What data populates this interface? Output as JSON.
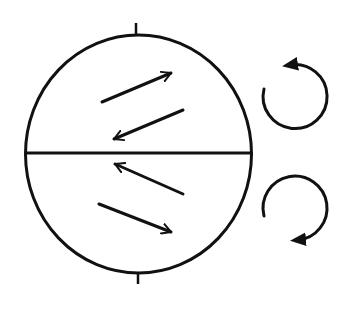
{
  "diagram": {
    "type": "globe-deflection",
    "colors": {
      "background": "#ffffff",
      "ink": "#111111"
    },
    "globe": {
      "cx": 138.5,
      "cy": 154,
      "rx": 113,
      "ry": 119,
      "stroke_width": 3
    },
    "equator": {
      "x1": 26,
      "y1": 153,
      "x2": 251,
      "y2": 153,
      "stroke_width": 3
    },
    "pole_ticks": [
      {
        "name": "north-pole-tick",
        "x1": 136,
        "y1": 23,
        "x2": 136,
        "y2": 35
      },
      {
        "name": "south-pole-tick",
        "x1": 138,
        "y1": 273,
        "x2": 138,
        "y2": 284
      }
    ],
    "deflection_arrows": [
      {
        "name": "arrow-northeast-upper",
        "hemisphere": "northern",
        "direction": "up-right",
        "x1": 102,
        "y1": 102,
        "x2": 171,
        "y2": 73
      },
      {
        "name": "arrow-southwest-upper",
        "hemisphere": "northern",
        "direction": "down-left",
        "x1": 183,
        "y1": 110,
        "x2": 114,
        "y2": 139
      },
      {
        "name": "arrow-northwest-lower",
        "hemisphere": "southern",
        "direction": "up-left",
        "x1": 183,
        "y1": 194,
        "x2": 115,
        "y2": 164
      },
      {
        "name": "arrow-southeast-lower",
        "hemisphere": "southern",
        "direction": "down-right",
        "x1": 99,
        "y1": 204,
        "x2": 171,
        "y2": 232
      }
    ],
    "rotation_arrows": [
      {
        "name": "counterclockwise-rotation",
        "hemisphere": "northern",
        "sense": "counterclockwise",
        "cx": 296,
        "cy": 95,
        "r": 32
      },
      {
        "name": "clockwise-rotation",
        "hemisphere": "southern",
        "sense": "clockwise",
        "cx": 296,
        "cy": 210,
        "r": 32
      }
    ]
  }
}
